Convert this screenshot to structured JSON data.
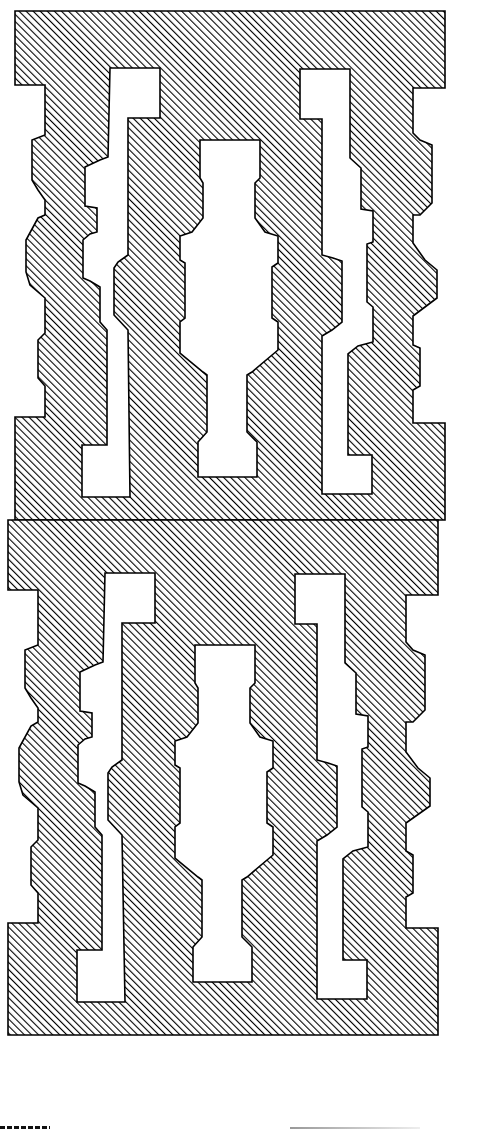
{
  "figure": {
    "units": [
      {
        "name": "upper-unit",
        "features": [
          "left-stepped-edge",
          "left-j-slot",
          "central-cavity",
          "right-l-slot",
          "right-stepped-edge"
        ]
      },
      {
        "name": "lower-unit",
        "features": [
          "left-stepped-edge",
          "left-j-slot",
          "central-cavity",
          "right-l-slot",
          "right-stepped-edge"
        ]
      }
    ],
    "fill_style": "diagonal-hatch",
    "colors": {
      "ink": "#000000",
      "background": "#ffffff"
    }
  }
}
